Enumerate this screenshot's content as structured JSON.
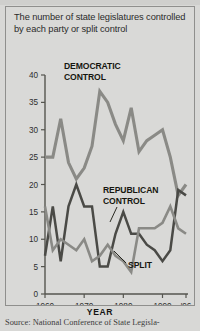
{
  "topstrip": {
    "ghost_text": ""
  },
  "headline": "The number of state legislatures controlled by each party or split control",
  "year_axis_title": "YEAR",
  "source": "Source: National Conference of State Legisla-",
  "annotations": {
    "democratic": "DEMOCRATIC\nCONTROL",
    "democratic_line1": "DEMOCRATIC",
    "democratic_line2": "CONTROL",
    "republican_line1": "REPUBLICAN",
    "republican_line2": "CONTROL",
    "split": "SPLIT"
  },
  "colors": {
    "background": "#d9d9d7",
    "border": "#8f8f8d",
    "democratic": "#8a8a86",
    "republican": "#4a4a46",
    "split": "#8a8a86",
    "axis": "#55554f",
    "text": "#2b2b2b"
  },
  "chart_data": {
    "type": "line",
    "title": "The number of state legislatures controlled by each party or split control",
    "xlabel": "YEAR",
    "ylabel": "",
    "xlim": [
      1960,
      1996
    ],
    "ylim": [
      0,
      40
    ],
    "yticks": [
      0,
      5,
      10,
      15,
      20,
      25,
      30,
      35,
      40
    ],
    "xticks": [
      1960,
      1970,
      1980,
      1990,
      1996
    ],
    "xticklabels": [
      "1960",
      "1970",
      "1980",
      "1990",
      "'96"
    ],
    "grid": false,
    "legend": "annotations-inline",
    "x": [
      1960,
      1962,
      1964,
      1966,
      1968,
      1970,
      1972,
      1974,
      1976,
      1978,
      1980,
      1982,
      1984,
      1986,
      1988,
      1990,
      1992,
      1994,
      1996
    ],
    "series": [
      {
        "name": "DEMOCRATIC CONTROL",
        "color": "#8a8a86",
        "values": [
          25,
          25,
          32,
          24,
          21,
          23,
          27,
          37,
          35,
          31,
          28,
          34,
          26,
          28,
          29,
          30,
          25,
          18,
          20
        ]
      },
      {
        "name": "REPUBLICAN CONTROL",
        "color": "#4a4a46",
        "values": [
          7,
          16,
          6,
          16,
          20,
          16,
          16,
          5,
          5,
          11,
          15,
          11,
          11,
          9,
          8,
          6,
          8,
          19,
          18
        ]
      },
      {
        "name": "SPLIT",
        "color": "#8a8a86",
        "values": [
          16,
          8,
          10,
          9,
          8,
          10,
          6,
          7,
          9,
          7,
          6,
          4,
          12,
          12,
          12,
          13,
          16,
          12,
          11
        ]
      }
    ]
  }
}
